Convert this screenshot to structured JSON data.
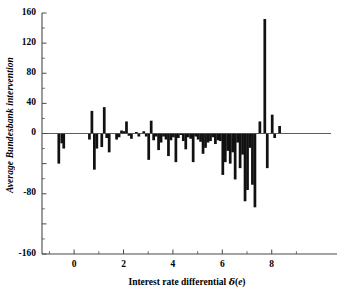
{
  "chart_data": {
    "type": "bar",
    "title": "",
    "subtitle": "",
    "xlabel": "Interest rate differential δ(e)",
    "xlabel_parts": {
      "text": "Interest rate differential",
      "symbol": "δ",
      "arg_open": "(",
      "arg_var": "e",
      "arg_close": ")"
    },
    "ylabel": "Average Bundesbank intervention",
    "xlim": [
      -1.3,
      10.4
    ],
    "ylim": [
      -160,
      160
    ],
    "ytick_labels": [
      "160",
      "120",
      "80",
      "40",
      "0",
      "-40",
      "-80",
      "-120",
      "-160"
    ],
    "ytick_values": [
      160,
      120,
      80,
      40,
      0,
      -40,
      -80,
      -120,
      -160
    ],
    "ytick_labels_shown": [
      "160",
      "120",
      "80",
      "40",
      "0",
      "",
      "-80",
      "",
      "-160"
    ],
    "xtick_labels": [
      "0",
      "2",
      "4",
      "6",
      "8"
    ],
    "xtick_values": [
      0,
      2,
      4,
      6,
      8
    ],
    "minor_ytick_values": [
      140,
      100,
      60,
      20,
      -20,
      -60,
      -100,
      -140
    ],
    "grid": false,
    "legend": null,
    "bar_color": "#111111",
    "axis_color": "#4a4a4a",
    "bar_width": 0.11,
    "x": [
      -0.62,
      -0.5,
      -0.42,
      0.62,
      0.72,
      0.82,
      0.92,
      1.12,
      1.22,
      1.32,
      1.42,
      1.72,
      1.82,
      1.92,
      2.02,
      2.12,
      2.22,
      2.32,
      2.52,
      2.62,
      2.82,
      2.92,
      3.02,
      3.12,
      3.22,
      3.32,
      3.42,
      3.52,
      3.62,
      3.72,
      3.82,
      3.92,
      4.02,
      4.12,
      4.22,
      4.32,
      4.42,
      4.52,
      4.62,
      4.72,
      4.82,
      4.92,
      5.02,
      5.12,
      5.22,
      5.32,
      5.42,
      5.52,
      5.62,
      5.72,
      5.82,
      5.92,
      6.02,
      6.12,
      6.22,
      6.32,
      6.42,
      6.52,
      6.62,
      6.72,
      6.82,
      6.92,
      7.02,
      7.12,
      7.22,
      7.32,
      7.52,
      7.72,
      7.82,
      8.02,
      8.12,
      8.32
    ],
    "values": [
      -40,
      -13,
      -20,
      -8,
      30,
      -48,
      -20,
      -18,
      35,
      -6,
      -25,
      -8,
      -5,
      4,
      3,
      16,
      -3,
      -7,
      2,
      -4,
      3,
      -4,
      -35,
      17,
      -9,
      -4,
      -22,
      -12,
      -4,
      -8,
      -30,
      -9,
      -5,
      -38,
      -6,
      -2,
      -10,
      -21,
      -5,
      -7,
      -38,
      -4,
      -8,
      -11,
      -27,
      -19,
      -12,
      -10,
      -5,
      -14,
      -9,
      -10,
      -55,
      -38,
      -23,
      -40,
      -25,
      -61,
      -12,
      -46,
      -28,
      -90,
      -75,
      -19,
      -68,
      -98,
      16,
      152,
      -46,
      25,
      -6,
      10
    ]
  }
}
